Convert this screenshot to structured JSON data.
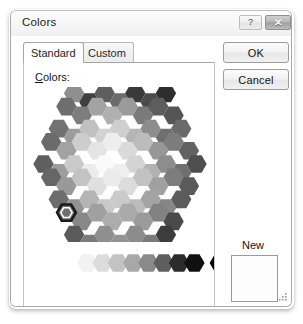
{
  "window": {
    "title": "Colors",
    "help_button_glyph": "?",
    "close_button_glyph": "✕"
  },
  "tabs": [
    {
      "label": "Standard",
      "active": true
    },
    {
      "label": "Custom",
      "active": false
    }
  ],
  "panel": {
    "colors_label_accel": "C",
    "colors_label_rest": "olors:"
  },
  "buttons": {
    "ok_label": "OK",
    "cancel_label": "Cancel"
  },
  "preview": {
    "new_label": "New",
    "current_label": "Current",
    "new_color": "#fdfdfd",
    "current_color": "#fdfdfd"
  },
  "palette": {
    "mode": "grayscale",
    "selected_index": 64,
    "wheel_rows": [
      {
        "count": 7,
        "colors": [
          "#8f8f8f",
          "#3f3f3f",
          "#5e5e5e",
          "#6b6b6b",
          "#3a3a3a",
          "#4c4c4c",
          "#2e2e2e"
        ]
      },
      {
        "count": 8,
        "colors": [
          "#6e6e6e",
          "#7d7d7d",
          "#a3a3a3",
          "#b0b0b0",
          "#9a9a9a",
          "#7a7a7a",
          "#5d5d5d",
          "#555555"
        ]
      },
      {
        "count": 9,
        "colors": [
          "#727272",
          "#9c9c9c",
          "#c0c0c0",
          "#d2d2d2",
          "#cfcfcf",
          "#b5b5b5",
          "#8d8d8d",
          "#6f6f6f",
          "#6a6a6a"
        ]
      },
      {
        "count": 10,
        "colors": [
          "#6b6b6b",
          "#a2a2a2",
          "#cdcdcd",
          "#e4e4e4",
          "#eeeeee",
          "#dadada",
          "#bcbcbc",
          "#979797",
          "#7c7c7c",
          "#626262"
        ]
      },
      {
        "count": 11,
        "colors": [
          "#5f5f5f",
          "#9d9d9d",
          "#cacaca",
          "#ececec",
          "#fafafa",
          "#efefef",
          "#d4d4d4",
          "#b2b2b2",
          "#8d8d8d",
          "#707070",
          "#4f4f4f"
        ]
      },
      {
        "count": 10,
        "colors": [
          "#666666",
          "#999999",
          "#c3c3c3",
          "#dfdfdf",
          "#ebebeb",
          "#dcdcdc",
          "#c2c2c2",
          "#a0a0a0",
          "#7d7d7d",
          "#5a5a5a"
        ]
      },
      {
        "count": 9,
        "colors": [
          "#6d6d6d",
          "#939393",
          "#b4b4b4",
          "#c9c9c9",
          "#cacaca",
          "#bbbbbb",
          "#a4a4a4",
          "#868686",
          "#5c5c5c"
        ]
      },
      {
        "count": 8,
        "colors": [
          "#6f6f6f",
          "#888888",
          "#a0a0a0",
          "#adadad",
          "#aaaaaa",
          "#9b9b9b",
          "#828282",
          "#4a4a4a"
        ]
      },
      {
        "count": 7,
        "colors": [
          "#5a5a5a",
          "#7b7b7b",
          "#8f8f8f",
          "#949494",
          "#8c8c8c",
          "#7a7a7a",
          "#3c3c3c"
        ]
      }
    ],
    "ramp_colors": [
      "#ffffff",
      "#f2f2f2",
      "#dcdcdc",
      "#c3c3c3",
      "#a8a8a8",
      "#8a8a8a",
      "#5e5e5e",
      "#2b2b2b",
      "#101010"
    ],
    "extra_swatch_color": "#050505"
  }
}
